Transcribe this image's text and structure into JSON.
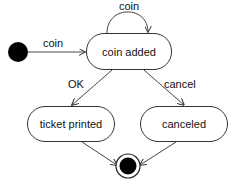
{
  "diagram": {
    "type": "uml-state-machine",
    "states": [
      {
        "id": "coin_added",
        "label": "coin added"
      },
      {
        "id": "ticket_printed",
        "label": "ticket printed"
      },
      {
        "id": "canceled",
        "label": "canceled"
      }
    ],
    "pseudostates": {
      "initial": "initial-state",
      "final": "final-state"
    },
    "transitions": [
      {
        "from": "initial",
        "to": "coin_added",
        "label": "coin"
      },
      {
        "from": "coin_added",
        "to": "coin_added",
        "label": "coin"
      },
      {
        "from": "coin_added",
        "to": "ticket_printed",
        "label": "OK"
      },
      {
        "from": "coin_added",
        "to": "canceled",
        "label": "cancel"
      },
      {
        "from": "ticket_printed",
        "to": "final",
        "label": ""
      },
      {
        "from": "canceled",
        "to": "final",
        "label": ""
      }
    ]
  }
}
